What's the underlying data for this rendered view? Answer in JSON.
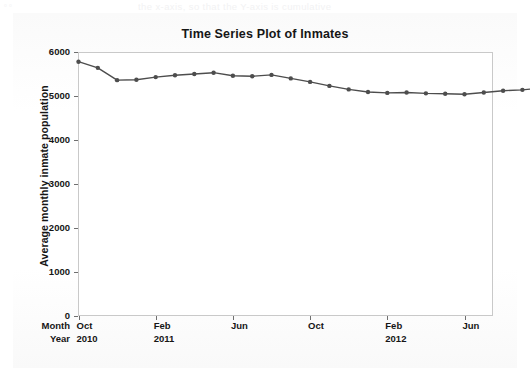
{
  "page": {
    "bleed_text": "the x-axis, so that the Y-axis is cumulative",
    "corner_marks": "▫ ▫"
  },
  "chart_data": {
    "type": "line",
    "title": "Time Series Plot of Inmates",
    "xlabel": "",
    "ylabel": "Average monthly inmate population",
    "ylim": [
      0,
      6000
    ],
    "y_ticks": [
      0,
      1000,
      2000,
      3000,
      4000,
      5000,
      6000
    ],
    "y_tick_labels": [
      "0",
      "1000",
      "2000",
      "3000",
      "4000",
      "5000",
      "6000"
    ],
    "grid": false,
    "legend": "none",
    "marker": "filled-circle",
    "line_color": "#4d4d4d",
    "marker_color": "#4d4d4d",
    "x_axis_rows": [
      {
        "row_label": "Month",
        "values": [
          "Oct",
          "Feb",
          "Jun",
          "Oct",
          "Feb",
          "Jun"
        ]
      },
      {
        "row_label": "Year",
        "values": [
          "2010",
          "2011",
          "",
          "",
          "2012",
          ""
        ]
      }
    ],
    "x_tick_index": [
      0,
      4,
      8,
      12,
      16,
      20
    ],
    "x": [
      "Oct 2010",
      "Nov 2010",
      "Dec 2010",
      "Jan 2011",
      "Feb 2011",
      "Mar 2011",
      "Apr 2011",
      "May 2011",
      "Jun 2011",
      "Jul 2011",
      "Aug 2011",
      "Sep 2011",
      "Oct 2011",
      "Nov 2011",
      "Dec 2011",
      "Jan 2012",
      "Feb 2012",
      "Mar 2012",
      "Apr 2012",
      "May 2012",
      "Jun 2012",
      "Jul 2012",
      "Aug 2012",
      "Sep 2012",
      "Oct 2012"
    ],
    "values": [
      5780,
      5640,
      5360,
      5370,
      5430,
      5470,
      5500,
      5530,
      5460,
      5450,
      5480,
      5400,
      5320,
      5230,
      5150,
      5090,
      5070,
      5080,
      5060,
      5050,
      5040,
      5080,
      5120,
      5140,
      5180
    ]
  }
}
